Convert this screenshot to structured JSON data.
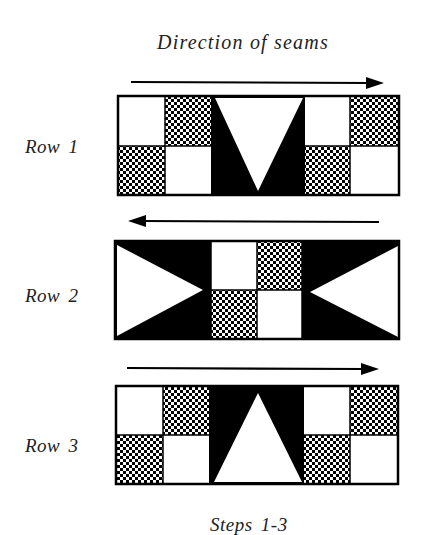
{
  "title": "Direction of seams",
  "caption": "Steps 1-3",
  "colors": {
    "ink": "#000000",
    "paper": "#ffffff",
    "text": "#222222"
  },
  "rows": [
    {
      "label": "Row 1",
      "arrow_direction": "right",
      "blocks": [
        "white-square",
        "checker-square",
        "checker-square",
        "white-square",
        "inverted-triangle-v",
        "white-square",
        "checker-square",
        "checker-square",
        "white-square"
      ],
      "center_unit": "black background with white inverted triangle (V)"
    },
    {
      "label": "Row 2",
      "arrow_direction": "left",
      "blocks": [
        "right-pointing-triangle",
        "white-square",
        "checker-square",
        "checker-square",
        "white-square",
        "left-pointing-triangle"
      ],
      "center_unit": "four-patch of white and checkered squares"
    },
    {
      "label": "Row 3",
      "arrow_direction": "right",
      "blocks": [
        "white-square",
        "checker-square",
        "checker-square",
        "white-square",
        "upright-triangle",
        "white-square",
        "checker-square",
        "checker-square",
        "white-square"
      ],
      "center_unit": "black background with white upright triangle"
    }
  ]
}
